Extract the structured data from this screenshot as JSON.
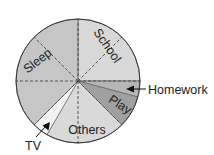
{
  "chart_data": {
    "type": "pie",
    "title": "",
    "unit": "hours",
    "total": 24,
    "grid": "dashed radial lines every 45 degrees (3 hours)",
    "start_angle_deg": 0,
    "direction": "clockwise from 12 o'clock",
    "slices": [
      {
        "label": "School",
        "value": 6,
        "color": "#d8d8d8",
        "label_angle": 45,
        "label_rotate": 55,
        "callout": false
      },
      {
        "label": "Homework",
        "value": 1,
        "color": "#b6b6b6",
        "label_angle": 97,
        "label_rotate": 0,
        "callout": true
      },
      {
        "label": "Play",
        "value": 2,
        "color": "#a0a0a0",
        "label_angle": 118,
        "label_rotate": 32,
        "callout": false
      },
      {
        "label": "Others",
        "value": 5,
        "color": "#d9d9d9",
        "label_angle": 172,
        "label_rotate": 0,
        "callout": false
      },
      {
        "label": "TV",
        "value": 1,
        "color": "#f2f2f2",
        "label_angle": 217,
        "label_rotate": 0,
        "callout": true
      },
      {
        "label": "Sleep",
        "value": 9,
        "color": "#c6c6c6",
        "label_angle": 300,
        "label_rotate": -38,
        "callout": false
      }
    ]
  }
}
